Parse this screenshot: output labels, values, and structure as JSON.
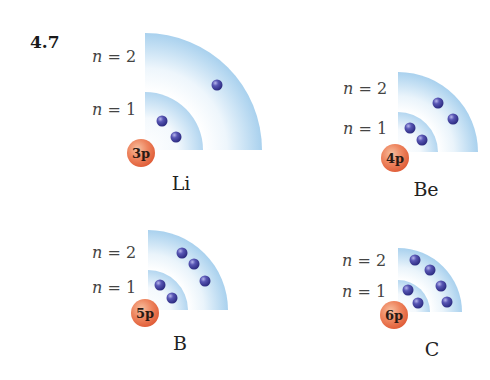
{
  "figure_number": "4.7",
  "colors": {
    "shell_edge": "#a9d1ee",
    "shell_inner": "#ffffff",
    "electron": "#3b3a94",
    "electron_highlight": "#9d9de0",
    "nucleus_core": "#e6663f",
    "nucleus_light": "#f6b190",
    "background": "#ffffff"
  },
  "atoms": [
    {
      "symbol": "Li",
      "nucleus_label": "3p",
      "shell_labels": [
        "n = 2",
        "n = 1"
      ],
      "n2_label": {
        "n": "n",
        "rest": " = 2"
      },
      "n1_label": {
        "n": "n",
        "rest": " = 1"
      },
      "electrons_n1": 2,
      "electrons_n2": 1
    },
    {
      "symbol": "Be",
      "nucleus_label": "4p",
      "n2_label": {
        "n": "n",
        "rest": " = 2"
      },
      "n1_label": {
        "n": "n",
        "rest": " = 1"
      },
      "electrons_n1": 2,
      "electrons_n2": 2
    },
    {
      "symbol": "B",
      "nucleus_label": "5p",
      "n2_label": {
        "n": "n",
        "rest": " = 2"
      },
      "n1_label": {
        "n": "n",
        "rest": " = 1"
      },
      "electrons_n1": 2,
      "electrons_n2": 3
    },
    {
      "symbol": "C",
      "nucleus_label": "6p",
      "n2_label": {
        "n": "n",
        "rest": " = 2"
      },
      "n1_label": {
        "n": "n",
        "rest": " = 1"
      },
      "electrons_n1": 2,
      "electrons_n2": 4
    }
  ]
}
